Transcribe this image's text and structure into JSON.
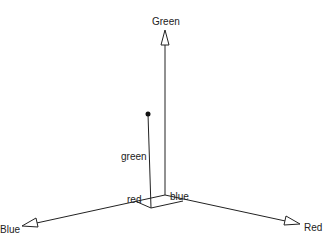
{
  "diagram": {
    "axes": {
      "green": {
        "label": "Green"
      },
      "red": {
        "label": "Red"
      },
      "blue": {
        "label": "Blue"
      }
    },
    "components": {
      "green": "green",
      "red": "red",
      "blue": "blue"
    }
  }
}
